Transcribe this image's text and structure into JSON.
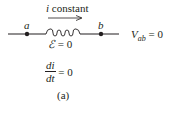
{
  "figure": {
    "current_label": {
      "var": "i",
      "text": " constant"
    },
    "node_a": "a",
    "node_b": "b",
    "emf": {
      "symbol": "ℰ",
      "rest": " = 0"
    },
    "voltage": {
      "var": "V",
      "sub": "ab",
      "rest": " = 0"
    },
    "derivative": {
      "num": "di",
      "den": "dt",
      "rest": " = 0"
    },
    "caption": "(a)",
    "colors": {
      "line": "#231f20",
      "background": "#ffffff"
    }
  }
}
